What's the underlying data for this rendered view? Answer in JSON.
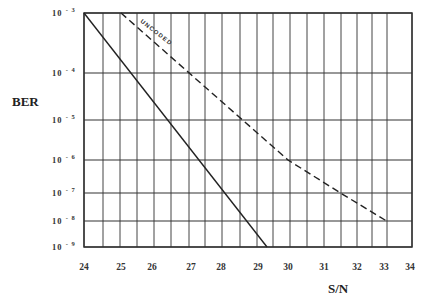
{
  "chart_data": {
    "type": "line",
    "title": "",
    "xlabel": "S/N",
    "ylabel": "BER",
    "xlim": [
      24,
      34
    ],
    "ylim": [
      1e-09,
      0.001
    ],
    "yscale": "log",
    "grid": true,
    "x_ticks": [
      "24",
      "25",
      "26",
      "27",
      "28",
      "29",
      "30",
      "31",
      "32",
      "33",
      "34"
    ],
    "y_ticks": [
      {
        "base": "10",
        "exp": "-3"
      },
      {
        "base": "10",
        "exp": "-4"
      },
      {
        "base": "10",
        "exp": "-5"
      },
      {
        "base": "10",
        "exp": "-6"
      },
      {
        "base": "10",
        "exp": "-7"
      },
      {
        "base": "10",
        "exp": "-8"
      },
      {
        "base": "10",
        "exp": "-9"
      }
    ],
    "series": [
      {
        "name": "coded",
        "style": "solid",
        "points": [
          [
            24.0,
            0.001
          ],
          [
            29.3,
            1e-09
          ]
        ]
      },
      {
        "name": "UNCODED",
        "style": "dashed",
        "points": [
          [
            25.0,
            0.001
          ],
          [
            30.0,
            1e-06
          ],
          [
            31.5,
            1e-07
          ],
          [
            33.1,
            1e-08
          ]
        ]
      }
    ],
    "annotations": [
      {
        "text": "UNCODED",
        "along_series": "UNCODED"
      }
    ]
  },
  "labels": {
    "ylabel": "BER",
    "xlabel": "S/N",
    "uncoded": "UNCODED"
  }
}
